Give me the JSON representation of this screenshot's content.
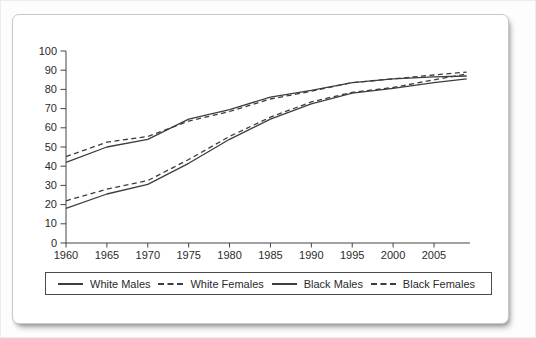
{
  "page": {
    "background": "#fdfdfd"
  },
  "card": {
    "background": "#ffffff",
    "border_color": "#c9c9c9"
  },
  "chart_data": {
    "type": "line",
    "title": "",
    "xlabel": "",
    "ylabel": "",
    "x": [
      1960,
      1965,
      1970,
      1975,
      1980,
      1985,
      1990,
      1995,
      2000,
      2005,
      2009
    ],
    "series": [
      {
        "name": "White Males",
        "style": "solid",
        "values": [
          42,
          50,
          54,
          64.5,
          69.5,
          76,
          79.5,
          83.5,
          85.5,
          86.5,
          87
        ]
      },
      {
        "name": "White Females",
        "style": "dashed",
        "values": [
          45,
          52.5,
          55.5,
          63.5,
          68.5,
          75,
          79,
          83.5,
          85.5,
          87.5,
          89
        ]
      },
      {
        "name": "Black Males",
        "style": "solid",
        "values": [
          18,
          25.5,
          30.5,
          41.5,
          54,
          64.5,
          72.5,
          78,
          80.5,
          83.5,
          85.5
        ]
      },
      {
        "name": "Black Females",
        "style": "dashed",
        "values": [
          22,
          28,
          32.5,
          43.5,
          55.5,
          65.5,
          73.5,
          78.5,
          81,
          85,
          88
        ]
      }
    ],
    "ylim": [
      0,
      100
    ],
    "ytick_step": 10,
    "yticks": [
      "0",
      "10",
      "20",
      "30",
      "40",
      "50",
      "60",
      "70",
      "80",
      "90",
      "100"
    ],
    "xticks": [
      1960,
      1965,
      1970,
      1975,
      1980,
      1985,
      1990,
      1995,
      2000,
      2005
    ],
    "xlim": [
      1960,
      2009.4
    ],
    "grid": false,
    "legend_position": "bottom",
    "line_color": "#3d3d3d",
    "axis_color": "#444444"
  },
  "legend": {
    "items": [
      {
        "label": "White Males",
        "style": "solid"
      },
      {
        "label": "White Females",
        "style": "dashed"
      },
      {
        "label": "Black Males",
        "style": "solid"
      },
      {
        "label": "Black Females",
        "style": "dashed"
      }
    ]
  }
}
